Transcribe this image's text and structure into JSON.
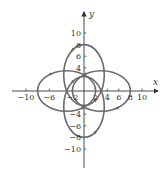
{
  "chart_data": {
    "type": "line",
    "title": "",
    "xlabel": "x",
    "ylabel": "y",
    "xlim": [
      -11,
      12
    ],
    "ylim": [
      -12,
      12
    ],
    "grid": false,
    "x_ticks": [
      -10,
      -6,
      -2,
      2,
      4,
      6,
      8,
      10
    ],
    "x_tick_labels": [
      "-10",
      "-6",
      "-2",
      "2",
      "4",
      "6",
      "8",
      "10"
    ],
    "y_ticks": [
      10,
      8,
      6,
      4,
      -4,
      -6,
      -8,
      -10
    ],
    "y_tick_labels": [
      "10",
      "8",
      "6",
      "4",
      "-4",
      "-6",
      "-8",
      "-10"
    ],
    "series": [
      {
        "name": "right loop",
        "shape": "closed loop",
        "x_range": [
          -2,
          8
        ],
        "y_range": [
          -3.5,
          3.5
        ]
      },
      {
        "name": "left loop",
        "shape": "closed loop",
        "x_range": [
          -8,
          2
        ],
        "y_range": [
          -3.5,
          3.5
        ]
      },
      {
        "name": "top loop",
        "shape": "closed loop",
        "x_range": [
          -3.5,
          3.5
        ],
        "y_range": [
          -2.5,
          8
        ]
      },
      {
        "name": "bottom loop",
        "shape": "closed loop",
        "x_range": [
          -3.5,
          3.5
        ],
        "y_range": [
          -8,
          2.5
        ]
      }
    ],
    "annotations": [
      "direction arrows along curve"
    ]
  },
  "colors": {
    "curve": "#6a6a6a",
    "axis": "#333333"
  }
}
